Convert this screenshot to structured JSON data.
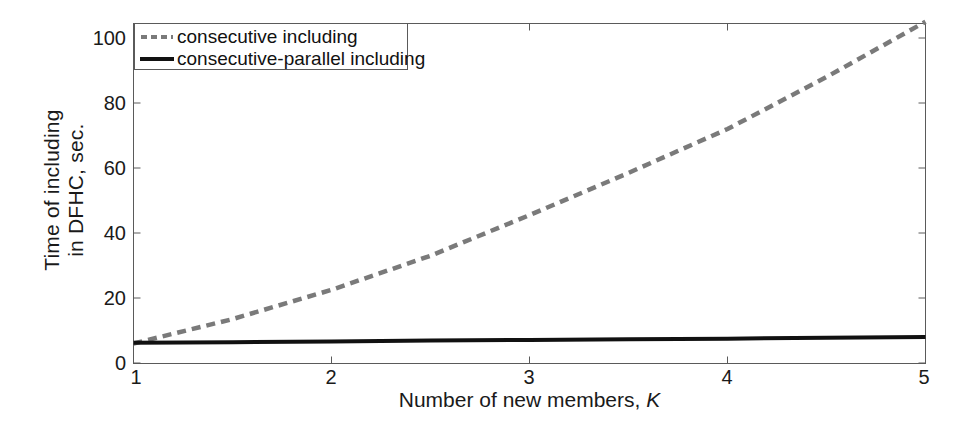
{
  "chart_data": {
    "type": "line",
    "title": "",
    "xlabel": "Number of new members, K",
    "xlabel_plain": "Number of new members,",
    "xlabel_italic": "K",
    "ylabel": "Time of including in DFHC, sec.",
    "ylabel_line1": "Time of including",
    "ylabel_line2": "in DFHC, sec.",
    "xlim": [
      1,
      5
    ],
    "ylim": [
      0,
      105
    ],
    "xticks": [
      "1",
      "2",
      "3",
      "4",
      "5"
    ],
    "xtick_values": [
      1,
      2,
      3,
      4,
      5
    ],
    "yticks": [
      "0",
      "20",
      "40",
      "60",
      "80",
      "100"
    ],
    "ytick_values": [
      0,
      20,
      40,
      60,
      80,
      100
    ],
    "grid": false,
    "legend_position": "top-left",
    "x": [
      1,
      1.5,
      2,
      2.5,
      3,
      3.5,
      4,
      4.5,
      5
    ],
    "series": [
      {
        "name": "consecutive including",
        "style": "dashed",
        "color": "#7a7a7a",
        "values": [
          6.0,
          13.5,
          22.5,
          33.0,
          45.5,
          58.5,
          72.0,
          88.0,
          105.0
        ]
      },
      {
        "name": "consecutive-parallel including",
        "style": "solid",
        "color": "#111111",
        "values": [
          6.2,
          6.4,
          6.6,
          6.9,
          7.1,
          7.3,
          7.5,
          7.8,
          8.0
        ]
      }
    ]
  },
  "legend": {
    "items": [
      {
        "label": "consecutive including",
        "style": "dashed"
      },
      {
        "label": "consecutive-parallel including",
        "style": "solid"
      }
    ]
  },
  "axes": {
    "frame_color": "#5a5a5a",
    "tick_color": "#5a5a5a",
    "text_color": "#1a1a1a"
  }
}
